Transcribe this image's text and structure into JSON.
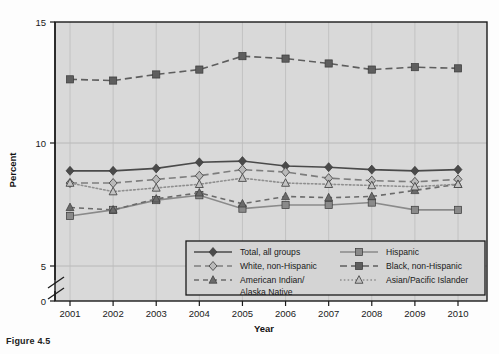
{
  "figure": {
    "caption": "Figure 4.5"
  },
  "chart_data": {
    "type": "line",
    "title": "",
    "xlabel": "Year",
    "ylabel": "Percent",
    "categories": [
      "2001",
      "2002",
      "2003",
      "2004",
      "2005",
      "2006",
      "2007",
      "2008",
      "2009",
      "2010"
    ],
    "x": [
      2001,
      2002,
      2003,
      2004,
      2005,
      2006,
      2007,
      2008,
      2009,
      2010
    ],
    "ylim": [
      0,
      15
    ],
    "yticks": [
      0,
      5,
      10,
      15
    ],
    "axis_break": true,
    "axis_break_between": [
      0,
      5
    ],
    "grid": "vertical-and-horizontal",
    "legend_position": "bottom-inside",
    "series": [
      {
        "name": "Total, all groups",
        "marker": "diamond",
        "line_style": "solid",
        "values": [
          8.9,
          8.9,
          9.0,
          9.25,
          9.3,
          9.1,
          9.05,
          8.95,
          8.9,
          8.95
        ]
      },
      {
        "name": "Hispanic",
        "marker": "square",
        "line_style": "solid",
        "values": [
          7.05,
          7.3,
          7.7,
          7.9,
          7.35,
          7.5,
          7.5,
          7.6,
          7.3,
          7.3
        ]
      },
      {
        "name": "White, non-Hispanic",
        "marker": "diamond-open",
        "line_style": "dashed",
        "values": [
          8.4,
          8.4,
          8.55,
          8.7,
          8.95,
          8.85,
          8.6,
          8.5,
          8.45,
          8.55
        ]
      },
      {
        "name": "Black, non-Hispanic",
        "marker": "square",
        "line_style": "dashed",
        "values": [
          12.65,
          12.6,
          12.85,
          13.05,
          13.6,
          13.5,
          13.3,
          13.05,
          13.15,
          13.1
        ]
      },
      {
        "name": "American Indian/\nAlaska Native",
        "label_line1": "American Indian/",
        "label_line2": "Alaska Native",
        "marker": "triangle",
        "line_style": "dashed-long",
        "values": [
          7.4,
          7.3,
          7.75,
          8.0,
          7.55,
          7.85,
          7.8,
          7.85,
          8.1,
          8.35
        ]
      },
      {
        "name": "Asian/Pacific Islander",
        "marker": "triangle-open",
        "line_style": "dotted",
        "values": [
          8.4,
          8.05,
          8.2,
          8.35,
          8.6,
          8.4,
          8.35,
          8.3,
          8.25,
          8.35
        ]
      }
    ]
  },
  "colors": {
    "plot_background": "#d9d9d9",
    "series_dark": "#4a4a4a",
    "series_mid": "#6e6e6e",
    "series_light": "#9a9a9a",
    "axis": "#1a1a1a",
    "gridline": "#b0b0b0",
    "legend_background": "#d4d4d4"
  },
  "legend": {
    "items": [
      {
        "label": "Total, all groups",
        "marker": "diamond",
        "style": "solid"
      },
      {
        "label": "Hispanic",
        "marker": "square",
        "style": "solid"
      },
      {
        "label": "White, non-Hispanic",
        "marker": "diamond-open",
        "style": "dashed"
      },
      {
        "label": "Black, non-Hispanic",
        "marker": "square",
        "style": "dashed"
      },
      {
        "label": "American Indian/",
        "label2": "Alaska Native",
        "marker": "triangle",
        "style": "dashed-long"
      },
      {
        "label": "Asian/Pacific Islander",
        "marker": "triangle-open",
        "style": "dotted"
      }
    ]
  }
}
